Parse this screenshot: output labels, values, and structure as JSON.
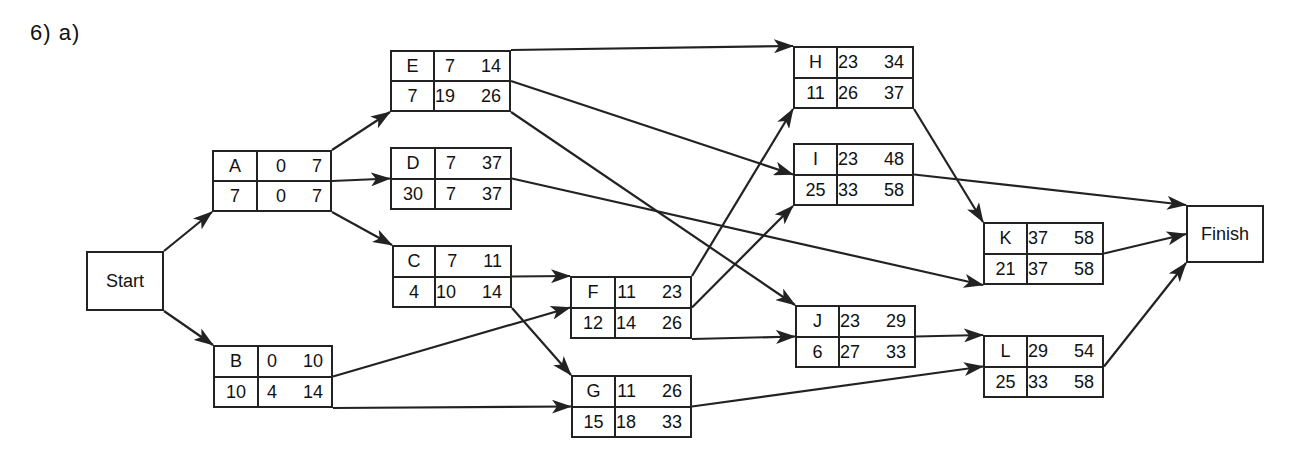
{
  "title": "6)  a)",
  "colors": {
    "stroke": "#222222",
    "background": "#ffffff"
  },
  "terminals": [
    {
      "id": "Start",
      "label": "Start",
      "x": 86,
      "y": 251,
      "w": 78,
      "h": 60
    },
    {
      "id": "Finish",
      "label": "Finish",
      "x": 1186,
      "y": 205,
      "w": 78,
      "h": 58
    }
  ],
  "nodes": [
    {
      "id": "A",
      "dur": "7",
      "es": "0",
      "ef": "7",
      "ls": "0",
      "lf": "7",
      "x": 212,
      "y": 150,
      "w": 120,
      "h": 62
    },
    {
      "id": "B",
      "dur": "10",
      "es": "0",
      "ef": "10",
      "ls": "4",
      "lf": "14",
      "x": 213,
      "y": 345,
      "w": 120,
      "h": 63
    },
    {
      "id": "C",
      "dur": "4",
      "es": "7",
      "ef": "11",
      "ls": "10",
      "lf": "14",
      "x": 392,
      "y": 245,
      "w": 120,
      "h": 63
    },
    {
      "id": "D",
      "dur": "30",
      "es": "7",
      "ef": "37",
      "ls": "7",
      "lf": "37",
      "x": 390,
      "y": 147,
      "w": 122,
      "h": 63
    },
    {
      "id": "E",
      "dur": "7",
      "es": "7",
      "ef": "14",
      "ls": "19",
      "lf": "26",
      "x": 390,
      "y": 50,
      "w": 121,
      "h": 62
    },
    {
      "id": "F",
      "dur": "12",
      "es": "11",
      "ef": "23",
      "ls": "14",
      "lf": "26",
      "x": 570,
      "y": 276,
      "w": 122,
      "h": 63
    },
    {
      "id": "G",
      "dur": "15",
      "es": "11",
      "ef": "26",
      "ls": "18",
      "lf": "33",
      "x": 571,
      "y": 375,
      "w": 121,
      "h": 63
    },
    {
      "id": "H",
      "dur": "11",
      "es": "23",
      "ef": "34",
      "ls": "26",
      "lf": "37",
      "x": 793,
      "y": 46,
      "w": 121,
      "h": 63
    },
    {
      "id": "I",
      "dur": "25",
      "es": "23",
      "ef": "48",
      "ls": "33",
      "lf": "58",
      "x": 793,
      "y": 143,
      "w": 121,
      "h": 63
    },
    {
      "id": "J",
      "dur": "6",
      "es": "23",
      "ef": "29",
      "ls": "27",
      "lf": "33",
      "x": 795,
      "y": 305,
      "w": 121,
      "h": 63
    },
    {
      "id": "K",
      "dur": "21",
      "es": "37",
      "ef": "58",
      "ls": "37",
      "lf": "58",
      "x": 983,
      "y": 222,
      "w": 121,
      "h": 63
    },
    {
      "id": "L",
      "dur": "25",
      "es": "29",
      "ef": "54",
      "ls": "33",
      "lf": "58",
      "x": 983,
      "y": 335,
      "w": 121,
      "h": 63
    }
  ],
  "edges": [
    {
      "from": "Start",
      "to": "A",
      "from_port": "tr",
      "to_port": "bl"
    },
    {
      "from": "Start",
      "to": "B",
      "from_port": "br",
      "to_port": "tl"
    },
    {
      "from": "A",
      "to": "E",
      "from_port": "tr",
      "to_port": "bl"
    },
    {
      "from": "A",
      "to": "D",
      "from_port": "mr",
      "to_port": "ml"
    },
    {
      "from": "A",
      "to": "C",
      "from_port": "br",
      "to_port": "tl"
    },
    {
      "from": "B",
      "to": "F",
      "from_port": "mr",
      "to_port": "ml"
    },
    {
      "from": "B",
      "to": "G",
      "from_port": "br",
      "to_port": "ml"
    },
    {
      "from": "C",
      "to": "F",
      "from_port": "mr",
      "to_port": "tl"
    },
    {
      "from": "C",
      "to": "G",
      "from_port": "br",
      "to_port": "tl"
    },
    {
      "from": "E",
      "to": "H",
      "from_port": "tr",
      "to_port": "tl"
    },
    {
      "from": "E",
      "to": "I",
      "from_port": "mr",
      "to_port": "ml"
    },
    {
      "from": "E",
      "to": "J",
      "from_port": "br",
      "to_port": "tl"
    },
    {
      "from": "D",
      "to": "K",
      "from_port": "mr",
      "to_port": "bl"
    },
    {
      "from": "F",
      "to": "H",
      "from_port": "tr",
      "to_port": "bl"
    },
    {
      "from": "F",
      "to": "I",
      "from_port": "mr",
      "to_port": "bl"
    },
    {
      "from": "F",
      "to": "J",
      "from_port": "br",
      "to_port": "ml"
    },
    {
      "from": "G",
      "to": "L",
      "from_port": "mr",
      "to_port": "ml"
    },
    {
      "from": "H",
      "to": "K",
      "from_port": "br",
      "to_port": "tl"
    },
    {
      "from": "I",
      "to": "Finish",
      "from_port": "mr",
      "to_port": "tl"
    },
    {
      "from": "J",
      "to": "L",
      "from_port": "mr",
      "to_port": "tl"
    },
    {
      "from": "K",
      "to": "Finish",
      "from_port": "mr",
      "to_port": "ml"
    },
    {
      "from": "L",
      "to": "Finish",
      "from_port": "mr",
      "to_port": "bl"
    }
  ]
}
